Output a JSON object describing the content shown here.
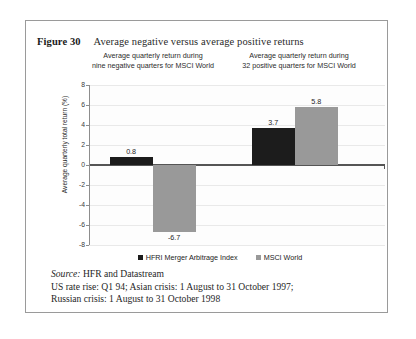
{
  "figure": {
    "number": "Figure 30",
    "title": "Average negative versus average positive returns"
  },
  "subtitles": {
    "left_line1": "Average quarterly return during",
    "left_line2": "nine negative quarters for MSCI World",
    "right_line1": "Average quarterly return during",
    "right_line2": "32 positive quarters for MSCI World"
  },
  "legend": {
    "series1": "HFRI Merger Arbitrage Index",
    "series2": "MSCI World"
  },
  "footer": {
    "source_label": "Source:",
    "source_text": "HFR and Datastream",
    "line2": "US rate rise: Q1 94; Asian crisis: 1 August to 31 October 1997;",
    "line3": "Russian crisis: 1 August to 31 October 1998"
  },
  "axis": {
    "ylabel": "Average quarterly total return (%)",
    "ticks": [
      "8",
      "6",
      "4",
      "2",
      "0",
      "-2",
      "-4",
      "-6",
      "-8"
    ]
  },
  "colors": {
    "series1": "#1c1c1c",
    "series2": "#999999",
    "grid": "#e9e9e9",
    "zero_line": "#555555",
    "border": "#9a9a9a"
  },
  "chart_data": {
    "type": "bar",
    "title": "Average negative versus average positive returns",
    "xlabel": "",
    "ylabel": "Average quarterly total return (%)",
    "ylim": [
      -8,
      8
    ],
    "ytick_step": 2,
    "grid": true,
    "legend_position": "bottom",
    "categories": [
      "Average quarterly return during nine negative quarters for MSCI World",
      "Average quarterly return during 32 positive quarters for MSCI World"
    ],
    "series": [
      {
        "name": "HFRI Merger Arbitrage Index",
        "color": "#1c1c1c",
        "values": [
          0.8,
          3.7
        ]
      },
      {
        "name": "MSCI World",
        "color": "#999999",
        "values": [
          -6.7,
          5.8
        ]
      }
    ],
    "data_labels": [
      {
        "series": "HFRI Merger Arbitrage Index",
        "category_index": 0,
        "text": "0.8"
      },
      {
        "series": "MSCI World",
        "category_index": 0,
        "text": "-6.7"
      },
      {
        "series": "HFRI Merger Arbitrage Index",
        "category_index": 1,
        "text": "3.7"
      },
      {
        "series": "MSCI World",
        "category_index": 1,
        "text": "5.8"
      }
    ]
  }
}
